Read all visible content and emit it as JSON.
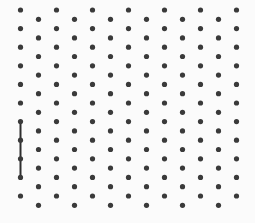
{
  "board": {
    "width": 255,
    "height": 223,
    "background": "#fbfbfb",
    "dot_color": "#3a3a3a",
    "dot_radius": 2.6,
    "line_color": "#2e2e2e",
    "line_width": 2,
    "columns": 13,
    "rows_per_column": 11,
    "col_x_start": 20.5,
    "col_spacing": 18,
    "odd_col_y_start": 10,
    "even_col_y_start": 19.3,
    "row_spacing": 18.6
  },
  "segments": [
    {
      "col": 0,
      "from_row": 6,
      "to_row": 9
    }
  ]
}
